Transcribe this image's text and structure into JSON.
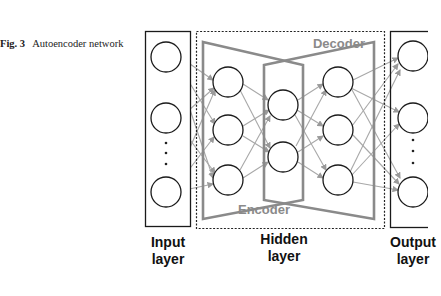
{
  "caption": {
    "figure_label": "Fig. 3",
    "title": "Autoencoder network"
  },
  "diagram": {
    "regions": {
      "decoder_label": "Decoder",
      "encoder_label": "Encoder"
    },
    "layers": [
      {
        "name": "input",
        "line1": "Input",
        "line2": "layer",
        "nodes": 3,
        "ellipsis": true
      },
      {
        "name": "encoder-hidden",
        "nodes": 3
      },
      {
        "name": "hidden",
        "line1": "Hidden",
        "line2": "layer",
        "nodes": 2
      },
      {
        "name": "decoder-hidden",
        "nodes": 3
      },
      {
        "name": "output",
        "line1": "Output",
        "line2": "layer",
        "nodes": 3,
        "ellipsis": true
      }
    ],
    "colors": {
      "node_stroke": "#1a1a1a",
      "edge": "#a0a0a0",
      "trapezoid": "#8a8a8a",
      "region_text": "#8a8a8a",
      "box": "#1a1a1a"
    }
  }
}
